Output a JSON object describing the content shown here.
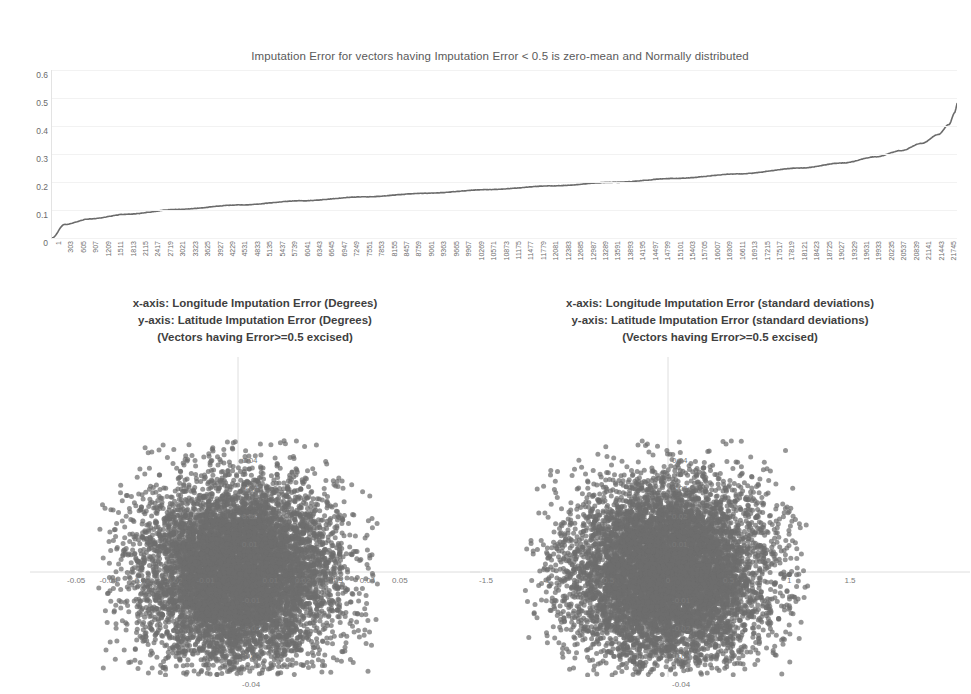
{
  "chart_data": [
    {
      "id": "top-sorted-error",
      "type": "line",
      "title": "Imputation Error for vectors having Imputation Error < 0.5 is zero-mean and Normally distributed",
      "xlabel": "",
      "ylabel": "",
      "ylim": [
        0,
        0.6
      ],
      "xlim": [
        1,
        21745
      ],
      "grid": true,
      "legend": "none",
      "ytick_labels": [
        "0.6",
        "0.5",
        "0.4",
        "0.3",
        "0.2",
        "0.1",
        "0"
      ],
      "ytick_values": [
        0.6,
        0.5,
        0.4,
        0.3,
        0.2,
        0.1,
        0
      ],
      "xtick_labels": [
        "1",
        "303",
        "605",
        "907",
        "1209",
        "1511",
        "1813",
        "2115",
        "2417",
        "2719",
        "3021",
        "3323",
        "3625",
        "3927",
        "4229",
        "4531",
        "4833",
        "5135",
        "5437",
        "5739",
        "6041",
        "6343",
        "6645",
        "6947",
        "7249",
        "7551",
        "7853",
        "8155",
        "8457",
        "8759",
        "9061",
        "9363",
        "9665",
        "9967",
        "10269",
        "10571",
        "10873",
        "11175",
        "11477",
        "11779",
        "12081",
        "12383",
        "12685",
        "12987",
        "13289",
        "13591",
        "13893",
        "14195",
        "14497",
        "14799",
        "15101",
        "15403",
        "15705",
        "16007",
        "16309",
        "16611",
        "16913",
        "17215",
        "17517",
        "17819",
        "18121",
        "18423",
        "18725",
        "19027",
        "19329",
        "19631",
        "19933",
        "20235",
        "20537",
        "20839",
        "21141",
        "21443",
        "21745"
      ],
      "series": [
        {
          "name": "Sorted Imputation Error",
          "color": "#6b6b6b",
          "x": [
            1,
            300,
            900,
            1800,
            3000,
            4500,
            6000,
            7500,
            9000,
            10500,
            12000,
            13500,
            15000,
            16500,
            18000,
            19000,
            19800,
            20400,
            20900,
            21300,
            21550,
            21700,
            21745
          ],
          "values": [
            0.0,
            0.048,
            0.068,
            0.085,
            0.102,
            0.118,
            0.133,
            0.147,
            0.16,
            0.173,
            0.186,
            0.199,
            0.213,
            0.229,
            0.25,
            0.268,
            0.29,
            0.312,
            0.338,
            0.37,
            0.405,
            0.45,
            0.48
          ]
        }
      ]
    },
    {
      "id": "scatter-degrees",
      "type": "scatter",
      "title_lines": [
        "x-axis: Longitude Imputation Error (Degrees)",
        "y-axis: Latitude Imputation Error (Degrees)",
        "(Vectors having Error>=0.5 excised)"
      ],
      "xlabel": "Longitude Imputation Error (Degrees)",
      "ylabel": "Latitude Imputation Error (Degrees)",
      "xlim": [
        -0.055,
        0.055
      ],
      "ylim": [
        -0.05,
        0.05
      ],
      "grid": true,
      "point_color": "#6e6e6e",
      "point_count": 21745,
      "distribution": "bivariate-normal zero-mean",
      "xtick_labels": [
        "-0.05",
        "-0.04",
        "-0.03",
        "-0.02",
        "-0.01",
        "0.01",
        "0.02",
        "0.03",
        "0.04",
        "0.05"
      ],
      "xtick_values": [
        -0.05,
        -0.04,
        -0.03,
        -0.02,
        -0.01,
        0.01,
        0.02,
        0.03,
        0.04,
        0.05
      ],
      "ytick_labels": [
        "0.04",
        "0.03",
        "0.02",
        "0.01",
        "-0.01",
        "-0.02",
        "-0.03",
        "-0.04"
      ],
      "ytick_values": [
        0.04,
        0.03,
        0.02,
        0.01,
        -0.01,
        -0.02,
        -0.03,
        -0.04
      ]
    },
    {
      "id": "scatter-stddev",
      "type": "scatter",
      "title_lines": [
        "x-axis: Longitude Imputation Error (standard deviations)",
        "y-axis: Latitude Imputation Error (standard deviations)",
        "(Vectors having Error>=0.5 excised)"
      ],
      "xlabel": "Longitude Imputation Error (standard deviations)",
      "ylabel": "Latitude Imputation Error (standard deviations)",
      "xlim": [
        -1.7,
        1.7
      ],
      "ylim": [
        -0.05,
        0.05
      ],
      "grid": true,
      "point_color": "#6e6e6e",
      "point_count": 21745,
      "distribution": "bivariate-normal zero-mean",
      "xtick_labels": [
        "-1.5",
        "-1",
        "-0.5",
        "0",
        "0.5",
        "1",
        "1.5"
      ],
      "xtick_values": [
        -1.5,
        -1,
        -0.5,
        0,
        0.5,
        1,
        1.5
      ],
      "ytick_labels": [
        "0.04",
        "0.03",
        "0.02",
        "0.01",
        "-0.01",
        "-0.02",
        "-0.03",
        "-0.04"
      ],
      "ytick_values": [
        0.04,
        0.03,
        0.02,
        0.01,
        -0.01,
        -0.02,
        -0.03,
        -0.04
      ]
    }
  ]
}
